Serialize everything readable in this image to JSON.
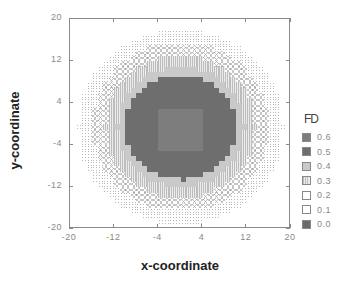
{
  "chart_data": {
    "type": "heatmap",
    "title": "",
    "xlabel": "x-coordinate",
    "ylabel": "y-coordinate",
    "xlim": [
      -20,
      20
    ],
    "ylim": [
      -20,
      20
    ],
    "x_ticks": [
      -20,
      -12,
      -4,
      4,
      12,
      20
    ],
    "y_ticks": [
      20,
      12,
      4,
      -4,
      -12,
      -20
    ],
    "grid": false,
    "legend": {
      "title": "FD",
      "position": "right",
      "entries": [
        {
          "label": "0.6",
          "value": 0.6,
          "style": "medium-gray solid",
          "color": "#7d7d7d"
        },
        {
          "label": "0.5",
          "value": 0.5,
          "style": "dark-gray solid",
          "color": "#6e6e6e"
        },
        {
          "label": "0.4",
          "value": 0.4,
          "style": "light-gray solid",
          "color": "#c9c9c9"
        },
        {
          "label": "0.3",
          "value": 0.3,
          "style": "vertical stripes",
          "color": "#bdbdbd"
        },
        {
          "label": "0.2",
          "value": 0.2,
          "style": "crosshatch",
          "color": "#969696"
        },
        {
          "label": "0.1",
          "value": 0.1,
          "style": "sparse dots",
          "color": "#b8b8b8"
        },
        {
          "label": "0.0",
          "value": 0.0,
          "style": "dark solid",
          "color": "#6a6a6a"
        }
      ]
    },
    "center": [
      0,
      -0.5
    ],
    "inner_square": {
      "fd": 0.6,
      "x_range": [
        -4,
        4
      ],
      "y_range": [
        -4.5,
        3.5
      ]
    },
    "radial_bands": [
      {
        "fd": 0.5,
        "r_max": 10.0
      },
      {
        "fd": 0.4,
        "r_max": 11.5
      },
      {
        "fd": 0.3,
        "r_max": 13.5
      },
      {
        "fd": 0.2,
        "r_max": 16.0
      },
      {
        "fd": 0.1,
        "r_max": 18.5
      }
    ],
    "outside_value": "blank",
    "extra_cells": [
      {
        "x": 0,
        "y": -11,
        "fd": 0.5
      }
    ]
  }
}
